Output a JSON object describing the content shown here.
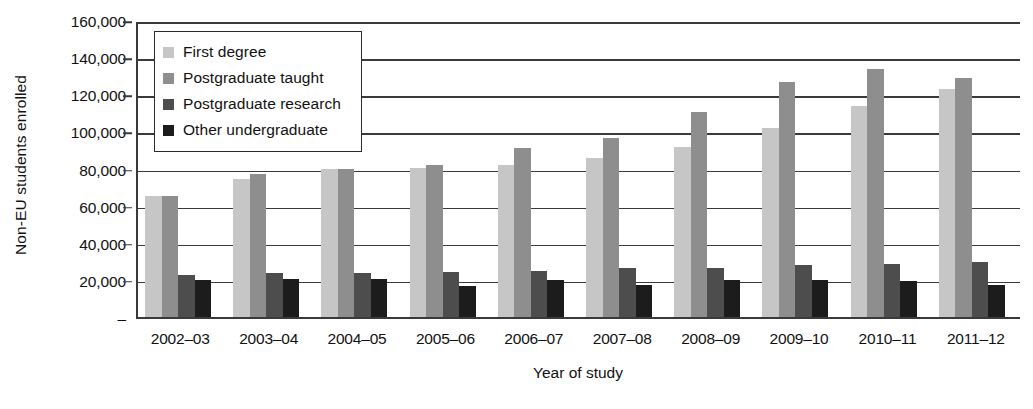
{
  "chart_data": {
    "type": "bar",
    "title": "",
    "xlabel": "Year of study",
    "ylabel": "Non-EU students enrolled",
    "ylim": [
      0,
      160000
    ],
    "ytick_values": [
      0,
      20000,
      40000,
      60000,
      80000,
      100000,
      120000,
      140000,
      160000
    ],
    "ytick_labels": [
      "–",
      "20,000",
      "40,000",
      "60,000",
      "80,000",
      "100,000",
      "120,000",
      "140,000",
      "160,000"
    ],
    "grid": true,
    "legend_position": "upper-left-inside",
    "categories": [
      "2002–03",
      "2003–04",
      "2004–05",
      "2005–06",
      "2006–07",
      "2007–08",
      "2008–09",
      "2009–10",
      "2010–11",
      "2011–12"
    ],
    "series": [
      {
        "name": "First degree",
        "color": "#c6c6c6",
        "values": [
          65000,
          74500,
          79500,
          80500,
          82000,
          85500,
          91500,
          102000,
          113500,
          123000
        ]
      },
      {
        "name": "Postgraduate taught",
        "color": "#8e8e8e",
        "values": [
          65000,
          77000,
          80000,
          82000,
          91000,
          96500,
          110500,
          126500,
          133500,
          128500
        ]
      },
      {
        "name": "Postgraduate research",
        "color": "#4d4d4d",
        "values": [
          22500,
          23500,
          23500,
          24500,
          25000,
          26500,
          26500,
          28000,
          28500,
          29500
        ]
      },
      {
        "name": "Other undergraduate",
        "color": "#1c1c1c",
        "values": [
          20000,
          20500,
          20500,
          16500,
          20000,
          17500,
          20000,
          20000,
          19500,
          17000
        ]
      }
    ]
  },
  "legend": {
    "items": [
      {
        "label": "First degree",
        "color": "#c6c6c6"
      },
      {
        "label": "Postgraduate taught",
        "color": "#8e8e8e"
      },
      {
        "label": "Postgraduate research",
        "color": "#4d4d4d"
      },
      {
        "label": "Other undergraduate",
        "color": "#1c1c1c"
      }
    ]
  },
  "axes": {
    "y_title": "Non-EU students enrolled",
    "x_title": "Year of study"
  }
}
